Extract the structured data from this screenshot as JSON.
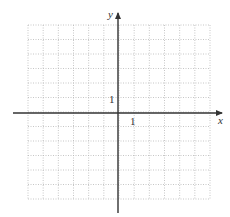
{
  "diagram": {
    "type": "coordinate-grid",
    "x_axis_label": "x",
    "y_axis_label": "y",
    "x_tick_label": "1",
    "y_tick_label": "1",
    "grid": {
      "columns": 12,
      "rows": 12,
      "x_range": [
        -6,
        6
      ],
      "y_range": [
        -6,
        6
      ],
      "line_style": "dotted"
    },
    "colors": {
      "grid": "#b8b8b8",
      "axis": "#333333",
      "background": "#ffffff"
    }
  }
}
